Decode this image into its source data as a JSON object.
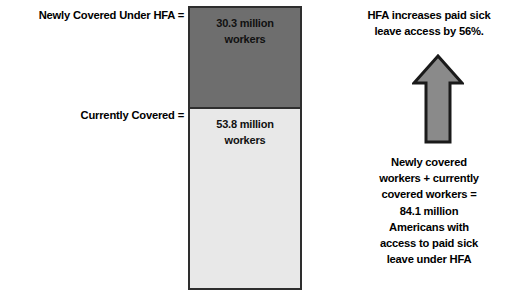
{
  "chart_data": {
    "type": "bar",
    "title": "",
    "subtitle": "",
    "xlabel": "",
    "ylabel": "",
    "stacked": true,
    "orientation": "vertical",
    "grid": false,
    "legend_position": "left-labels",
    "categories": [
      "Workers with paid sick leave access under HFA"
    ],
    "series": [
      {
        "name": "Newly Covered Under HFA",
        "label": "Newly Covered Under HFA =",
        "value": 30.3,
        "unit": "million workers",
        "value_label": "30.3 million workers",
        "color": "#6e6e6e"
      },
      {
        "name": "Currently Covered",
        "label": "Currently Covered =",
        "value": 53.8,
        "unit": "million workers",
        "value_label": "53.8 million workers",
        "color": "#e8e8e8"
      }
    ],
    "total": 84.1,
    "total_unit": "million Americans",
    "percent_increase": 56,
    "annotations": [
      "HFA increases paid sick leave access by 56%.",
      "Newly covered workers + currently covered workers = 84.1 million Americans with access to paid sick leave under HFA"
    ],
    "ylim": [
      0,
      84.1
    ]
  },
  "labels": {
    "newly_covered": "Newly Covered Under HFA =",
    "currently_covered": "Currently Covered ="
  },
  "bar": {
    "newly_line1": "30.3 million",
    "newly_line2": "workers",
    "current_line1": "53.8 million",
    "current_line2": "workers"
  },
  "annotation": {
    "headline_line1": "HFA increases paid sick",
    "headline_line2": "leave access by 56%.",
    "arrow_icon": "arrow-up-icon",
    "summary_line1": "Newly covered",
    "summary_line2": "workers + currently",
    "summary_line3": "covered workers =",
    "summary_line4": "84.1 million",
    "summary_line5": "Americans with",
    "summary_line6": "access to paid sick",
    "summary_line7": "leave under HFA"
  },
  "colors": {
    "newly_covered_fill": "#6e6e6e",
    "currently_covered_fill": "#e8e8e8",
    "bar_outline": "#2e2e2e",
    "arrow_fill": "#8a8a8a",
    "arrow_outline": "#1a1a1a",
    "text": "#000000",
    "background": "#ffffff"
  }
}
